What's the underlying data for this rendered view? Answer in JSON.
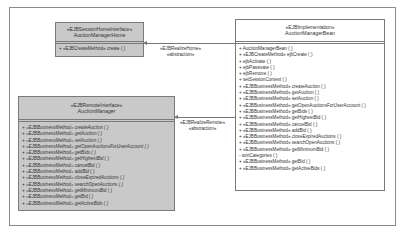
{
  "diagram": {
    "home_interface": {
      "stereotype": "«EJBSessionHomeInterface»",
      "name": "AuctionManagerHome",
      "operations": [
        "+ «EJBCreateMethod» create ( )"
      ]
    },
    "implementation": {
      "stereotype": "«EJBImplementation»",
      "name": "AuctionManagerBean",
      "operations": [
        "+ AuctionManagerBean ( )",
        "+ «EJBCreateMethod» ejbCreate ( )",
        "+ ejbActivate ( )",
        "+ ejbPassivate ( )",
        "+ ejbRemove ( )",
        "+ setSessionContext ( )",
        "+ «EJBBusinessMethod» createAuction ( )",
        "+ «EJBBusinessMethod» getAuction ( )",
        "+ «EJBBusinessMethod» setAuction ( )",
        "+ «EJBBusinessMethod» getOpenAuctionsForUserAccount ( )",
        "+ «EJBBusinessMethod» getBids ( )",
        "+ «EJBBusinessMethod» getHighestBid ( )",
        "+ «EJBBusinessMethod» cancelBid ( )",
        "+ «EJBBusinessMethod» addBid ( )",
        "+ «EJBBusinessMethod» closeExpiredAuctions ( )",
        "+ «EJBBusinessMethod» searchOpenAuctions ( )",
        "+ «EJBBusinessMethod» getMinimumBid ( )",
        "- sortCategories ( )",
        "+ «EJBBusinessMethod» getBid ( )",
        "+ «EJBBusinessMethod» getActiveBids ( )"
      ]
    },
    "remote_interface": {
      "stereotype": "«EJBRemoteInterface»",
      "name": "AuctionManager",
      "operations": [
        "+ «EJBBusinessMethod» createAuction ( )",
        "+ «EJBBusinessMethod» getAuction ( )",
        "+ «EJBBusinessMethod» setAuction ( )",
        "+ «EJBBusinessMethod» getOpenAuctionsForUserAccount ( )",
        "+ «EJBBusinessMethod» getBids ( )",
        "+ «EJBBusinessMethod» getHighestBid ( )",
        "+ «EJBBusinessMethod» cancelBid ( )",
        "+ «EJBBusinessMethod» addBid ( )",
        "+ «EJBBusinessMethod» closeExpiredAuctions ( )",
        "+ «EJBBusinessMethod» searchOpenAuctions ( )",
        "+ «EJBBusinessMethod» getMinimumBid ( )",
        "+ «EJBBusinessMethod» getBid ( )",
        "+ «EJBBusinessMethod» getActiveBids ( )"
      ]
    },
    "relations": {
      "realize_home": {
        "stereotype": "«EJBRealizeHome»",
        "kind": "«abstraction»"
      },
      "realize_remote": {
        "stereotype": "«EJBRealizeRemote»",
        "kind": "«abstraction»"
      }
    }
  }
}
